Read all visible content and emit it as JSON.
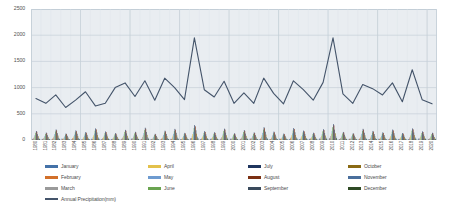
{
  "chart_data": {
    "type": "bar",
    "title": "",
    "xlabel": "",
    "ylabel": "",
    "ylim": [
      0,
      2500
    ],
    "yticks": [
      0,
      500,
      1000,
      1500,
      2000,
      2500
    ],
    "grid": true,
    "legend_position": "bottom",
    "categories": [
      "1980",
      "1981",
      "1982",
      "1983",
      "1984",
      "1985",
      "1986",
      "1987",
      "1988",
      "1989",
      "1990",
      "1991",
      "1992",
      "1993",
      "1994",
      "1995",
      "1996",
      "1997",
      "1998",
      "1999",
      "2000",
      "2001",
      "2002",
      "2003",
      "2004",
      "2005",
      "2006",
      "2007",
      "2008",
      "2009",
      "2010",
      "2011",
      "2012",
      "2013",
      "2014",
      "2015",
      "2016",
      "2017",
      "2018",
      "2019",
      "2020"
    ],
    "series": [
      {
        "name": "January",
        "color": "#4472a8",
        "type": "bar",
        "values": [
          18,
          22,
          12,
          30,
          15,
          9,
          25,
          14,
          20,
          11,
          28,
          16,
          21,
          13,
          24,
          19,
          35,
          17,
          23,
          10,
          26,
          14,
          31,
          18,
          12,
          27,
          20,
          15,
          22,
          29,
          33,
          16,
          24,
          13,
          19,
          26,
          11,
          21,
          17,
          28,
          14
        ]
      },
      {
        "name": "February",
        "color": "#d2702a",
        "type": "bar",
        "values": [
          24,
          16,
          28,
          19,
          33,
          12,
          21,
          26,
          15,
          30,
          18,
          23,
          11,
          27,
          20,
          14,
          38,
          22,
          17,
          31,
          13,
          25,
          19,
          29,
          16,
          21,
          34,
          12,
          26,
          18,
          41,
          15,
          23,
          28,
          11,
          19,
          24,
          16,
          30,
          13,
          22
        ]
      },
      {
        "name": "March",
        "color": "#9a9a9a",
        "type": "bar",
        "values": [
          42,
          35,
          51,
          28,
          46,
          33,
          57,
          39,
          30,
          48,
          36,
          60,
          25,
          44,
          52,
          31,
          72,
          41,
          37,
          55,
          29,
          47,
          34,
          63,
          40,
          26,
          58,
          45,
          32,
          50,
          78,
          38,
          27,
          54,
          43,
          36,
          49,
          31,
          57,
          40,
          33
        ]
      },
      {
        "name": "April",
        "color": "#e3c14b",
        "type": "bar",
        "values": [
          68,
          55,
          80,
          47,
          73,
          59,
          88,
          64,
          50,
          77,
          61,
          92,
          44,
          70,
          84,
          52,
          112,
          66,
          58,
          86,
          48,
          75,
          57,
          97,
          63,
          45,
          90,
          71,
          54,
          82,
          121,
          60,
          49,
          85,
          68,
          57,
          79,
          51,
          88,
          65,
          53
        ]
      },
      {
        "name": "May",
        "color": "#6e9bd0",
        "type": "bar",
        "values": [
          95,
          78,
          112,
          68,
          102,
          84,
          124,
          90,
          72,
          108,
          86,
          131,
          64,
          98,
          118,
          75,
          158,
          93,
          82,
          121,
          70,
          106,
          80,
          137,
          89,
          66,
          127,
          100,
          77,
          115,
          170,
          85,
          71,
          119,
          96,
          81,
          111,
          73,
          124,
          92,
          76
        ]
      },
      {
        "name": "June",
        "color": "#6aa450",
        "type": "bar",
        "values": [
          138,
          115,
          162,
          100,
          148,
          122,
          178,
          131,
          106,
          155,
          126,
          188,
          95,
          142,
          170,
          110,
          228,
          135,
          119,
          174,
          103,
          152,
          117,
          197,
          129,
          98,
          182,
          144,
          112,
          166,
          244,
          124,
          104,
          171,
          139,
          118,
          160,
          107,
          178,
          133,
          111
        ]
      },
      {
        "name": "July",
        "color": "#1f355e",
        "type": "bar",
        "values": [
          172,
          142,
          201,
          124,
          184,
          151,
          221,
          163,
          131,
          193,
          156,
          234,
          118,
          177,
          212,
          136,
          284,
          168,
          148,
          216,
          128,
          189,
          145,
          245,
          160,
          122,
          227,
          179,
          139,
          206,
          303,
          154,
          129,
          213,
          173,
          146,
          199,
          133,
          221,
          165,
          138
        ]
      },
      {
        "name": "August",
        "color": "#7b3013",
        "type": "bar",
        "values": [
          158,
          130,
          185,
          114,
          169,
          139,
          203,
          150,
          120,
          177,
          143,
          215,
          108,
          163,
          195,
          125,
          261,
          155,
          136,
          199,
          118,
          174,
          133,
          225,
          147,
          112,
          209,
          165,
          128,
          189,
          279,
          142,
          119,
          196,
          159,
          134,
          183,
          122,
          203,
          152,
          127
        ]
      },
      {
        "name": "September",
        "color": "#3a4a5c",
        "type": "bar",
        "values": [
          112,
          92,
          131,
          81,
          120,
          98,
          144,
          106,
          85,
          126,
          101,
          153,
          77,
          116,
          138,
          89,
          185,
          110,
          96,
          141,
          84,
          123,
          94,
          159,
          104,
          79,
          148,
          117,
          91,
          134,
          198,
          101,
          84,
          139,
          113,
          95,
          130,
          87,
          144,
          108,
          90
        ]
      },
      {
        "name": "October",
        "color": "#8a6a14",
        "type": "bar",
        "values": [
          72,
          59,
          85,
          52,
          77,
          63,
          93,
          68,
          55,
          81,
          65,
          99,
          50,
          75,
          89,
          58,
          120,
          71,
          62,
          91,
          54,
          79,
          61,
          103,
          67,
          51,
          95,
          76,
          59,
          86,
          128,
          65,
          55,
          90,
          73,
          62,
          84,
          56,
          93,
          70,
          58
        ]
      },
      {
        "name": "November",
        "color": "#4a6f9c",
        "type": "bar",
        "values": [
          38,
          31,
          45,
          27,
          41,
          33,
          49,
          36,
          29,
          43,
          34,
          53,
          26,
          40,
          47,
          31,
          64,
          38,
          33,
          48,
          28,
          42,
          32,
          55,
          35,
          27,
          50,
          40,
          31,
          46,
          68,
          34,
          29,
          48,
          39,
          33,
          45,
          30,
          49,
          37,
          31
        ]
      },
      {
        "name": "December",
        "color": "#2f4a25",
        "type": "bar",
        "values": [
          20,
          16,
          24,
          14,
          22,
          17,
          26,
          19,
          15,
          23,
          18,
          28,
          13,
          21,
          25,
          16,
          34,
          20,
          17,
          26,
          15,
          22,
          17,
          29,
          19,
          14,
          27,
          21,
          16,
          24,
          36,
          18,
          15,
          25,
          20,
          17,
          24,
          16,
          26,
          19,
          16
        ]
      },
      {
        "name": "Annual Precipitation(mm)",
        "color": "#44546a",
        "type": "line",
        "values": [
          790,
          700,
          860,
          620,
          760,
          920,
          650,
          700,
          1000,
          1090,
          830,
          1130,
          760,
          1180,
          1000,
          770,
          1950,
          960,
          820,
          1120,
          700,
          900,
          700,
          1180,
          890,
          690,
          1130,
          960,
          760,
          1100,
          1950,
          880,
          700,
          1060,
          980,
          860,
          1090,
          730,
          1340,
          770,
          690
        ]
      }
    ],
    "legend_layout": {
      "columns": 4,
      "rows": 3,
      "trailing_item": "Annual Precipitation(mm)"
    }
  }
}
